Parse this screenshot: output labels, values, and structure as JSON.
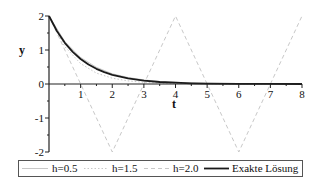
{
  "chart_data": {
    "type": "line",
    "title": "",
    "xlabel": "t",
    "ylabel": "y",
    "xlim": [
      0,
      8
    ],
    "ylim": [
      -2,
      2
    ],
    "x_ticks": [
      "1",
      "2",
      "3",
      "4",
      "5",
      "6",
      "7",
      "8"
    ],
    "y_ticks": [
      "-2",
      "-1",
      "0",
      "1",
      "2"
    ],
    "grid": false,
    "legend_position": "bottom",
    "series": [
      {
        "name": "h=0.5",
        "style": "solid",
        "color": "#c8c8c8",
        "x": [
          0,
          0.5,
          1,
          1.5,
          2,
          2.5,
          3,
          3.5,
          4,
          5,
          6,
          7,
          8
        ],
        "y": [
          2,
          1.25,
          0.78,
          0.49,
          0.3,
          0.19,
          0.12,
          0.07,
          0.05,
          0.02,
          0.01,
          0.0,
          0.0
        ]
      },
      {
        "name": "h=1.5",
        "style": "dotted",
        "color": "#c8c8c8",
        "x": [
          0,
          0.5,
          1,
          1.5,
          2,
          2.5,
          3,
          3.5,
          4,
          5,
          6,
          7,
          8
        ],
        "y": [
          2,
          1.1,
          0.6,
          0.32,
          0.17,
          0.09,
          0.05,
          0.03,
          0.02,
          0.01,
          0.0,
          0.0,
          0.0
        ]
      },
      {
        "name": "h=2.0",
        "style": "dashed",
        "color": "#c8c8c8",
        "x": [
          0,
          2,
          4,
          6,
          8
        ],
        "y": [
          2,
          -2,
          2,
          -2,
          2
        ]
      },
      {
        "name": "Exakte Lösung",
        "style": "solid-bold",
        "color": "#1a1a1a",
        "x": [
          0,
          0.25,
          0.5,
          0.75,
          1,
          1.25,
          1.5,
          1.75,
          2,
          2.5,
          3,
          3.5,
          4,
          4.5,
          5,
          6,
          7,
          8
        ],
        "y": [
          2,
          1.558,
          1.213,
          0.945,
          0.736,
          0.573,
          0.446,
          0.348,
          0.271,
          0.164,
          0.1,
          0.06,
          0.037,
          0.022,
          0.013,
          0.005,
          0.002,
          0.001
        ]
      }
    ]
  },
  "legend": {
    "items": [
      "h=0.5",
      "h=1.5",
      "h=2.0",
      "Exakte Lösung"
    ]
  }
}
